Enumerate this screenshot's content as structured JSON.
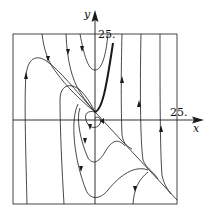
{
  "figure": {
    "type": "phase-portrait",
    "axes": {
      "x_label": "x",
      "y_label": "y",
      "x_tick_label": "25.",
      "y_tick_label": "25."
    },
    "colors": {
      "line": "#1a1a1a",
      "background": "#ffffff"
    }
  }
}
